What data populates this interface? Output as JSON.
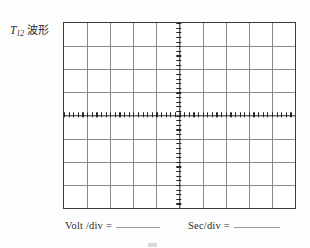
{
  "label": {
    "symbol": "T",
    "subscript": "12",
    "text": "波形",
    "full": "T12 波形"
  },
  "graticule": {
    "name": "oscilloscope-graticule",
    "columns": 10,
    "rows": 8,
    "subdivisions_per_division": 5,
    "border_color": "#3a3a3a",
    "gridline_color": "#8a8a8a",
    "axis_color": "#242424",
    "background_color": "#ffffff",
    "center_column_index": 5,
    "center_row_index": 4
  },
  "caption": {
    "volt": {
      "label": "Volt /div =",
      "value": ""
    },
    "sec": {
      "label": "Sec/div =",
      "value": ""
    }
  }
}
